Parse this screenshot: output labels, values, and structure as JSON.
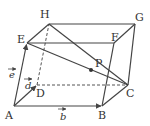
{
  "diagram": {
    "type": "parallelepiped",
    "stroke_color": "#444444",
    "vertices": {
      "A": {
        "label": "A",
        "x": 14,
        "y": 106
      },
      "B": {
        "label": "B",
        "x": 102,
        "y": 106
      },
      "C": {
        "label": "C",
        "x": 128,
        "y": 85
      },
      "D": {
        "label": "D",
        "x": 37,
        "y": 85
      },
      "E": {
        "label": "E",
        "x": 27,
        "y": 43
      },
      "F": {
        "label": "F",
        "x": 114,
        "y": 43
      },
      "G": {
        "label": "G",
        "x": 135,
        "y": 24
      },
      "H": {
        "label": "H",
        "x": 49,
        "y": 24
      },
      "P": {
        "label": "P",
        "x": 91,
        "y": 71
      }
    },
    "vectors": {
      "b": {
        "label": "b",
        "from": "A",
        "to": "B"
      },
      "d": {
        "label": "d",
        "from": "A",
        "to": "D"
      },
      "e": {
        "label": "e",
        "from": "A",
        "to": "E"
      }
    },
    "segments_solid": [
      "A-B",
      "B-C",
      "C-G",
      "G-H",
      "H-E",
      "E-A",
      "E-F",
      "F-G",
      "F-B",
      "E-C",
      "H-C"
    ],
    "segments_dashed": [
      "A-D",
      "D-C",
      "D-H"
    ]
  }
}
